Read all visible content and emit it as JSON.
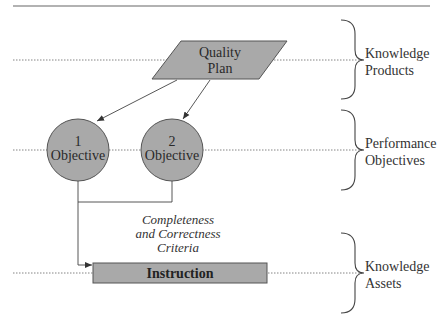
{
  "diagram": {
    "colors": {
      "fill": "#a9a9a9",
      "stroke": "#555555",
      "line": "#444444",
      "dotted": "#666666"
    },
    "quality_plan": {
      "line1": "Quality",
      "line2": "Plan"
    },
    "objectives": [
      {
        "number": "1",
        "label": "Objective"
      },
      {
        "number": "2",
        "label": "Objective"
      }
    ],
    "criteria": {
      "line1": "Completeness",
      "line2": "and Correctness",
      "line3": "Criteria"
    },
    "instruction": {
      "label": "Instruction"
    },
    "layers": [
      {
        "line1": "Knowledge",
        "line2": "Products"
      },
      {
        "line1": "Performance",
        "line2": "Objectives"
      },
      {
        "line1": "Knowledge",
        "line2": "Assets"
      }
    ]
  }
}
